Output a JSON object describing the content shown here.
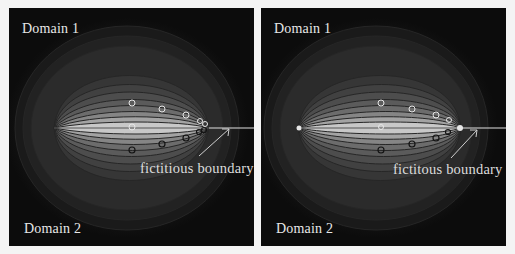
{
  "figure": {
    "panels": [
      {
        "id": "left",
        "domain_top_label": "Domain 1",
        "domain_bottom_label": "Domain 2",
        "annotation": "fictitious boundary"
      },
      {
        "id": "right",
        "domain_top_label": "Domain 1",
        "domain_bottom_label": "Domain 2",
        "annotation": "fictitous boundary"
      }
    ],
    "colors": {
      "background": "#0c0c0c",
      "contour_line": "#2a2a2a",
      "inner_band": "#cfcfcf",
      "boundary_line": "#e0e0e0",
      "marker_light": "#e6e6e6",
      "marker_dark": "#1a1a1a"
    }
  }
}
